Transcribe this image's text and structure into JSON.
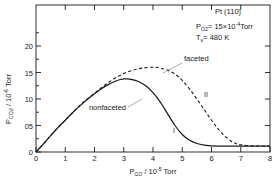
{
  "chart_data": {
    "type": "line",
    "title": "",
    "xlabel": "P_CO / 10^-5 Torr",
    "ylabel": "P_CO2 / 10^-6 Torr",
    "xlim": [
      0,
      8
    ],
    "ylim": [
      0,
      2.3
    ],
    "grid": false,
    "legend": "inline-annotations",
    "xticks": [
      "0",
      "1",
      "2",
      "3",
      "4",
      "5",
      "6",
      "7",
      "8"
    ],
    "xtick_values": [
      0,
      1,
      2,
      3,
      4,
      5,
      6,
      7,
      8
    ],
    "yticks": [
      "0",
      "05",
      "10",
      "15",
      "20"
    ],
    "ytick_values": [
      0,
      0.5,
      1.0,
      1.5,
      2.0
    ],
    "series": [
      {
        "name": "nonfaceted",
        "label": "nonfaceted",
        "curve_id": "I",
        "style": "solid",
        "color": "#1a1a1a",
        "peak": {
          "x": 3.1,
          "y": 1.38
        },
        "x": [
          0,
          0.25,
          0.5,
          0.75,
          1.0,
          1.25,
          1.5,
          1.75,
          2.0,
          2.25,
          2.5,
          2.75,
          3.0,
          3.1,
          3.25,
          3.5,
          3.75,
          4.0,
          4.25,
          4.5,
          4.75,
          5.0,
          5.25,
          5.5,
          5.75,
          6.0,
          6.5,
          7.0,
          7.5,
          8.0
        ],
        "y": [
          0,
          0.15,
          0.31,
          0.46,
          0.6,
          0.74,
          0.87,
          0.99,
          1.1,
          1.2,
          1.28,
          1.345,
          1.378,
          1.38,
          1.372,
          1.33,
          1.25,
          1.12,
          0.94,
          0.72,
          0.5,
          0.33,
          0.22,
          0.16,
          0.13,
          0.115,
          0.11,
          0.11,
          0.11,
          0.11
        ]
      },
      {
        "name": "faceted",
        "label": "faceted",
        "curve_id": "II",
        "style": "dashed",
        "color": "#1a1a1a",
        "peak": {
          "x": 4.05,
          "y": 1.6
        },
        "x": [
          0,
          0.25,
          0.5,
          0.75,
          1.0,
          1.25,
          1.5,
          1.75,
          2.0,
          2.25,
          2.5,
          2.75,
          3.0,
          3.25,
          3.5,
          3.75,
          4.0,
          4.05,
          4.25,
          4.5,
          4.75,
          5.0,
          5.25,
          5.5,
          5.75,
          6.0,
          6.25,
          6.5,
          6.75,
          7.0,
          7.5,
          8.0
        ],
        "y": [
          0,
          0.15,
          0.31,
          0.46,
          0.6,
          0.74,
          0.88,
          1.0,
          1.11,
          1.22,
          1.32,
          1.41,
          1.48,
          1.535,
          1.57,
          1.592,
          1.6,
          1.6,
          1.585,
          1.545,
          1.47,
          1.35,
          1.19,
          1.0,
          0.8,
          0.6,
          0.42,
          0.28,
          0.18,
          0.135,
          0.115,
          0.115
        ]
      }
    ],
    "annotations": {
      "material": "Pt (110)",
      "pressure_label": "P",
      "pressure_sub": "O",
      "pressure_sub2": "2",
      "pressure_eq": "= 15",
      "pressure_mult": "×10",
      "pressure_exp": "-4",
      "pressure_unit": "Torr",
      "temp_label": "T",
      "temp_sub": "s",
      "temp_eq": "= 480 K"
    },
    "axis_label_parts": {
      "y_main": "P",
      "y_sub": "CO",
      "y_sub2": "2",
      "y_div": " / 10",
      "y_exp": "-6",
      "y_unit": " Torr",
      "x_main": "P",
      "x_sub": "CO",
      "x_div": " / 10",
      "x_exp": "-5",
      "x_unit": " Torr"
    }
  }
}
